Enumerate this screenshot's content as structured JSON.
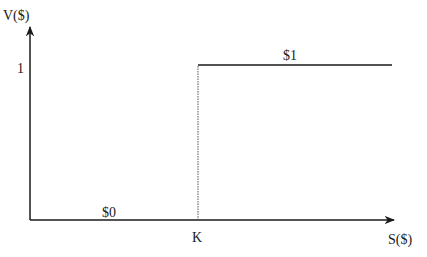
{
  "diagram": {
    "type": "step-payoff",
    "y_axis_label": "V($)",
    "x_axis_label": "S($)",
    "y_tick_label": "1",
    "x_tick_label": "K",
    "low_segment_label": "$0",
    "high_segment_label": "$1",
    "colors": {
      "line": "#1a1a1a",
      "dotted": "#555555",
      "background": "#ffffff"
    }
  }
}
